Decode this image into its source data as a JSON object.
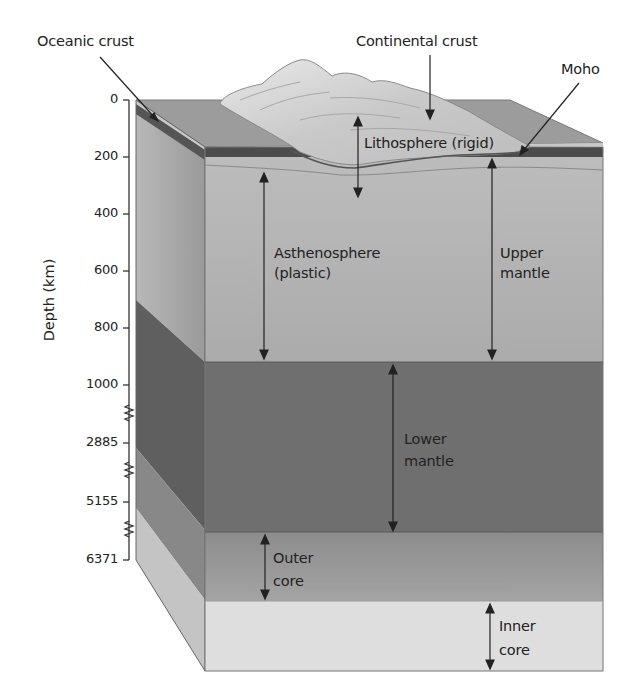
{
  "diagram": {
    "axis": {
      "title": "Depth (km)",
      "ticks": [
        "0",
        "200",
        "400",
        "600",
        "800",
        "1000",
        "2885",
        "5155",
        "6371"
      ],
      "breaks_between": [
        [
          "1000",
          "2885"
        ],
        [
          "2885",
          "5155"
        ],
        [
          "5155",
          "6371"
        ]
      ]
    },
    "labels": {
      "oceanic_crust": "Oceanic crust",
      "continental_crust": "Continental crust",
      "moho": "Moho",
      "lithosphere": "Lithosphere (rigid)",
      "asthenosphere_1": "Asthenosphere",
      "asthenosphere_2": "(plastic)",
      "upper_mantle_1": "Upper",
      "upper_mantle_2": "mantle",
      "lower_mantle_1": "Lower",
      "lower_mantle_2": "mantle",
      "outer_core_1": "Outer",
      "outer_core_2": "core",
      "inner_core_1": "Inner",
      "inner_core_2": "core"
    },
    "colors": {
      "top_face": "#9a9a9a",
      "crust_band": "#4a4a4a",
      "upper_mantle": "#b4b4b4",
      "lower_mantle": "#6e6e6e",
      "outer_core": "#9c9c9c",
      "inner_core": "#dcdcdc",
      "continent": "#d2d2d2"
    }
  }
}
